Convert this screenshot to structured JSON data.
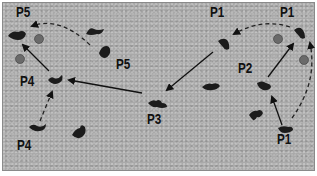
{
  "diagram": {
    "type": "movement-sequence",
    "background_color": "#a9a9a9",
    "labels": [
      {
        "id": "p5-top-left",
        "text": "P5",
        "x": 16,
        "y": 4
      },
      {
        "id": "p5-middle",
        "text": "P5",
        "x": 116,
        "y": 56
      },
      {
        "id": "p4-middle",
        "text": "P4",
        "x": 20,
        "y": 73
      },
      {
        "id": "p4-bottom",
        "text": "P4",
        "x": 17,
        "y": 137
      },
      {
        "id": "p3",
        "text": "P3",
        "x": 147,
        "y": 111
      },
      {
        "id": "p1-top-middle",
        "text": "P1",
        "x": 210,
        "y": 4
      },
      {
        "id": "p1-top-right",
        "text": "P1",
        "x": 280,
        "y": 4
      },
      {
        "id": "p2",
        "text": "P2",
        "x": 238,
        "y": 60
      },
      {
        "id": "p1-bottom-right",
        "text": "P1",
        "x": 277,
        "y": 131
      }
    ],
    "figures": [
      {
        "id": "fig-p5-top-left",
        "x": 15,
        "y": 33
      },
      {
        "id": "fig-p5-middle-upper",
        "x": 93,
        "y": 31
      },
      {
        "id": "fig-p5-middle-lower",
        "x": 104,
        "y": 50
      },
      {
        "id": "fig-p4-middle",
        "x": 55,
        "y": 79
      },
      {
        "id": "fig-p4-bottom-left",
        "x": 36,
        "y": 126
      },
      {
        "id": "fig-p4-bottom-right",
        "x": 79,
        "y": 132
      },
      {
        "id": "fig-p3",
        "x": 157,
        "y": 102
      },
      {
        "id": "fig-p3-right",
        "x": 212,
        "y": 88
      },
      {
        "id": "fig-p1-top-middle",
        "x": 224,
        "y": 44
      },
      {
        "id": "fig-p1-top-right",
        "x": 301,
        "y": 32
      },
      {
        "id": "fig-p2",
        "x": 263,
        "y": 86
      },
      {
        "id": "fig-p1-right-lower",
        "x": 256,
        "y": 114
      },
      {
        "id": "fig-p1-bottom-right",
        "x": 286,
        "y": 127
      }
    ],
    "balls": [
      {
        "id": "ball-1",
        "x": 39,
        "y": 39
      },
      {
        "id": "ball-2",
        "x": 20,
        "y": 59
      },
      {
        "id": "ball-3",
        "x": 278,
        "y": 39
      },
      {
        "id": "ball-4",
        "x": 304,
        "y": 60
      }
    ],
    "arrows": [
      {
        "id": "solid-p1-to-p3",
        "style": "solid",
        "from": [
          213,
          52
        ],
        "to": [
          167,
          90
        ]
      },
      {
        "id": "solid-p3-to-p4",
        "style": "solid",
        "from": [
          142,
          93
        ],
        "to": [
          69,
          80
        ]
      },
      {
        "id": "solid-p4-to-p5",
        "style": "solid",
        "from": [
          49,
          71
        ],
        "to": [
          23,
          45
        ]
      },
      {
        "id": "solid-p2-to-p1",
        "style": "solid",
        "from": [
          268,
          77
        ],
        "to": [
          293,
          44
        ]
      },
      {
        "id": "solid-p1-to-p2",
        "style": "solid",
        "from": [
          282,
          125
        ],
        "to": [
          272,
          97
        ]
      },
      {
        "id": "dashed-p4-to-p4",
        "style": "dashed",
        "from": [
          40,
          121
        ],
        "to": [
          52,
          92
        ]
      },
      {
        "id": "dashed-p5-to-p5",
        "style": "dashed",
        "from": [
          90,
          45
        ],
        "to": [
          32,
          26
        ],
        "curve": [
          60,
          16
        ]
      },
      {
        "id": "dashed-p1-to-p1",
        "style": "dashed",
        "from": [
          290,
          27
        ],
        "to": [
          234,
          34
        ],
        "curve": [
          262,
          18
        ]
      },
      {
        "id": "dashed-p1-bottom-to-top",
        "style": "dashed",
        "from": [
          292,
          118
        ],
        "to": [
          310,
          43
        ],
        "curve": [
          318,
          82
        ]
      }
    ]
  }
}
